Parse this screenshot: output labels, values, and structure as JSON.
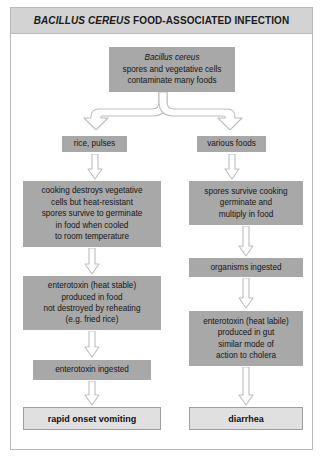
{
  "title": {
    "species": "BACILLUS CEREUS",
    "rest": " FOOD-ASSOCIATED INFECTION",
    "full": "BACILLUS CEREUS FOOD-ASSOCIATED INFECTION"
  },
  "colors": {
    "frame_border": "#b9b9b9",
    "title_bg": "#d3d3d3",
    "node_bg": "#a8a8a8",
    "outcome_bg": "#e0e0e0",
    "outcome_border": "#9e9e9e",
    "arrow_stroke": "#bdbdbd",
    "arrow_fill": "#ffffff",
    "page_bg": "#ffffff",
    "text": "#141414"
  },
  "nodes": {
    "source": {
      "line1": "Bacillus cereus",
      "line2": "spores and vegetative cells",
      "line3": "contaminate many foods"
    },
    "left_food": "rice, pulses",
    "right_food": "various foods",
    "left_cooking": "cooking destroys vegetative cells but heat-resistant spores survive to germinate in food when cooled to room temperature",
    "left_cooking_lines": [
      "cooking destroys vegetative",
      "cells but heat-resistant",
      "spores survive to germinate",
      "in food when cooled",
      "to room temperature"
    ],
    "right_spores": "spores survive cooking germinate and multiply in food",
    "right_spores_lines": [
      "spores survive cooking",
      "germinate and",
      "multiply in food"
    ],
    "left_toxin": "enterotoxin (heat stable) produced in food not destroyed by reheating (e.g. fried rice)",
    "left_toxin_lines": [
      "enterotoxin (heat stable)",
      "produced in food",
      "not destroyed by reheating",
      "(e.g. fried rice)"
    ],
    "right_organisms": "organisms ingested",
    "right_toxin": "enterotoxin (heat labile) produced in gut similar mode of action to cholera",
    "right_toxin_lines": [
      "enterotoxin (heat labile)",
      "produced in gut",
      "similar mode of",
      "action to cholera"
    ],
    "left_ingested": "enterotoxin ingested"
  },
  "outcomes": {
    "left": "rapid onset vomiting",
    "right": "diarrhea"
  },
  "connectors": {
    "branch": "forked-down-arrow",
    "down": "hollow-block-down-arrow"
  }
}
